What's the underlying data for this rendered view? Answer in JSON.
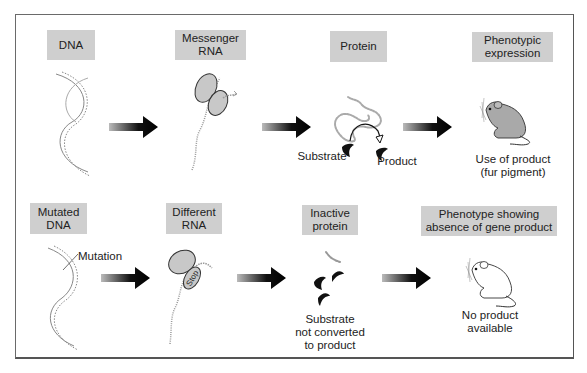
{
  "figure": {
    "rows": [
      {
        "name": "normal",
        "steps": [
          {
            "label": "DNA"
          },
          {
            "label": "Messenger\nRNA"
          },
          {
            "label": "Protein",
            "annotations": {
              "substrate": "Substrate",
              "product": "Product"
            }
          },
          {
            "label": "Phenotypic\nexpression",
            "caption": "Use of product\n(fur pigment)"
          }
        ]
      },
      {
        "name": "mutated",
        "steps": [
          {
            "label": "Mutated\nDNA",
            "annotation": "Mutation"
          },
          {
            "label": "Different\nRNA",
            "ribosome_text": "Stop"
          },
          {
            "label": "Inactive\nprotein",
            "caption": "Substrate\nnot converted\nto product"
          },
          {
            "label": "Phenotype showing\nabsence of gene product",
            "caption": "No product\navailable"
          }
        ]
      }
    ],
    "icons": [
      "dna-helix-icon",
      "ribosome-mrna-icon",
      "enzyme-protein-icon",
      "pigmented-mouse-icon",
      "flow-arrow-icon",
      "white-mouse-icon",
      "substrate-icon"
    ],
    "colors": {
      "label_box": "#cfcfcf",
      "border": "#6a6a6a",
      "arrow": "#000000",
      "ribosome": "#c8c8c8",
      "mouse_fill": "#a9a9a9"
    }
  }
}
